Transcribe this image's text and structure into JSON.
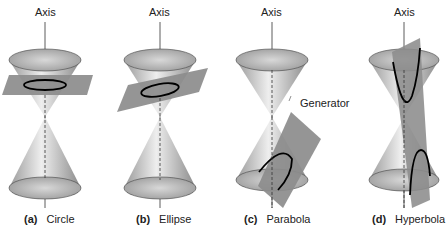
{
  "panels": [
    {
      "letter": "(a)",
      "name": "Circle",
      "axis_label": "Axis"
    },
    {
      "letter": "(b)",
      "name": "Ellipse",
      "axis_label": "Axis"
    },
    {
      "letter": "(c)",
      "name": "Parabola",
      "axis_label": "Axis",
      "annotation": "Generator"
    },
    {
      "letter": "(d)",
      "name": "Hyperbola",
      "axis_label": "Axis"
    }
  ],
  "colors": {
    "cone_light": "#e8e8e8",
    "cone_dark": "#8a8a8a",
    "plane": "#8c8c8c",
    "curve": "#000000"
  }
}
